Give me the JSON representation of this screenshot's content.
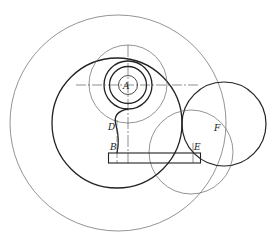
{
  "diagram": {
    "labels": {
      "A": "A",
      "B": "B",
      "D": "D",
      "E": "E",
      "F": "F"
    },
    "colors": {
      "line": "#222222",
      "thin": "#555555",
      "background": "#ffffff"
    }
  }
}
